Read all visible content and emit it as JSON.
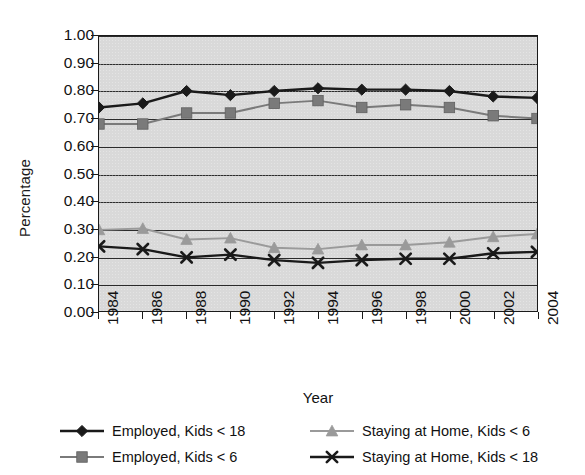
{
  "chart_data": {
    "type": "line",
    "title": "",
    "xlabel": "Year",
    "ylabel": "Percentage",
    "grid": true,
    "legend_position": "bottom",
    "categories": [
      "1984",
      "1986",
      "1988",
      "1990",
      "1992",
      "1994",
      "1996",
      "1998",
      "2000",
      "2002",
      "2004"
    ],
    "x": [
      1984,
      1986,
      1988,
      1990,
      1992,
      1994,
      1996,
      1998,
      2000,
      2002,
      2004
    ],
    "xlim": [
      1984,
      2004
    ],
    "ylim": [
      0.0,
      1.0
    ],
    "ytick_labels": [
      "0.00",
      "0.10",
      "0.20",
      "0.30",
      "0.40",
      "0.50",
      "0.60",
      "0.70",
      "0.80",
      "0.90",
      "1.00"
    ],
    "ytick_values": [
      0.0,
      0.1,
      0.2,
      0.3,
      0.4,
      0.5,
      0.6,
      0.7,
      0.8,
      0.9,
      1.0
    ],
    "series": [
      {
        "name": "Employed, Kids < 18",
        "color": "#1a1a1a",
        "marker": "diamond",
        "values": [
          0.74,
          0.755,
          0.8,
          0.785,
          0.8,
          0.81,
          0.805,
          0.805,
          0.8,
          0.78,
          0.775
        ]
      },
      {
        "name": "Employed, Kids < 6",
        "color": "#7a7a7a",
        "marker": "square",
        "values": [
          0.68,
          0.68,
          0.72,
          0.72,
          0.755,
          0.765,
          0.74,
          0.75,
          0.74,
          0.71,
          0.7
        ]
      },
      {
        "name": "Staying at Home, Kids < 6",
        "color": "#9a9a9a",
        "marker": "triangle",
        "values": [
          0.295,
          0.3,
          0.26,
          0.265,
          0.23,
          0.225,
          0.24,
          0.24,
          0.25,
          0.27,
          0.28
        ]
      },
      {
        "name": "Staying at Home, Kids < 18",
        "color": "#1a1a1a",
        "marker": "x",
        "values": [
          0.235,
          0.225,
          0.195,
          0.205,
          0.185,
          0.175,
          0.185,
          0.19,
          0.19,
          0.21,
          0.215
        ]
      }
    ]
  },
  "legend": {
    "order": [
      0,
      2,
      1,
      3
    ]
  },
  "colors": {
    "plot_background": "#d9d9d9",
    "axis": "#1a1a1a",
    "gridline": "#2b2b2b",
    "text": "#111111",
    "page_background": "#ffffff"
  }
}
